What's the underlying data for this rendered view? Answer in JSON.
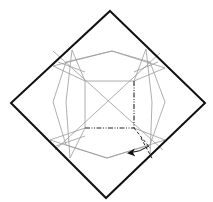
{
  "diagram": {
    "type": "origami-crease-pattern",
    "colors": {
      "background": "#ffffff",
      "outline": "#111111",
      "crease": "#9a9a9a",
      "fold_line": "#222222",
      "arrow": "#111111"
    },
    "outer_square": {
      "points": [
        [
          110,
          11
        ],
        [
          205,
          103
        ],
        [
          106,
          198
        ],
        [
          11,
          103
        ]
      ]
    },
    "octagon": {
      "points": [
        [
          112,
          51
        ],
        [
          150,
          62
        ],
        [
          165,
          102
        ],
        [
          150,
          145
        ],
        [
          107,
          158
        ],
        [
          66,
          145
        ],
        [
          53,
          102
        ],
        [
          66,
          62
        ]
      ]
    },
    "inner_square": {
      "points": [
        [
          85,
          81
        ],
        [
          134,
          81
        ],
        [
          134,
          128
        ],
        [
          85,
          128
        ]
      ]
    },
    "mountain_folds": [
      {
        "from": [
          134,
          81
        ],
        "to": [
          134,
          128
        ]
      },
      {
        "from": [
          85,
          128
        ],
        "to": [
          134,
          128
        ]
      }
    ],
    "valley_folds": [
      {
        "from": [
          134,
          128
        ],
        "to": [
          150,
          148
        ]
      },
      {
        "from": [
          140,
          140
        ],
        "to": [
          152,
          162
        ]
      }
    ],
    "arrow": {
      "from": [
        150,
        145
      ],
      "to": [
        128,
        153
      ],
      "direction": "left"
    }
  }
}
